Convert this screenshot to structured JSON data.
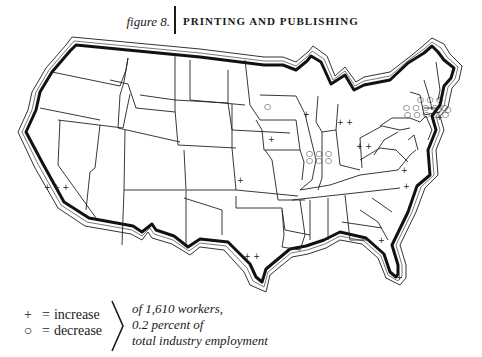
{
  "figure": {
    "label": "figure 8.",
    "title": "PRINTING AND PUBLISHING"
  },
  "legend": {
    "increase_glyph": "+",
    "increase_label": "increase",
    "decrease_glyph": "○",
    "decrease_label": "decrease",
    "equals": "=",
    "note_lines": [
      "of 1,610 workers,",
      "0.2 percent of",
      "total industry employment"
    ]
  },
  "map": {
    "subject": "United States by state",
    "unit": "1,610 workers per symbol",
    "symbols": [
      {
        "state": "California",
        "type": "increase",
        "count": 3,
        "glyph": "+++"
      },
      {
        "state": "Minnesota",
        "type": "decrease",
        "count": 1,
        "glyph": "○"
      },
      {
        "state": "Wisconsin",
        "type": "increase",
        "count": 1,
        "glyph": "+"
      },
      {
        "state": "Iowa",
        "type": "increase",
        "count": 1,
        "glyph": "+"
      },
      {
        "state": "Kansas",
        "type": "increase",
        "count": 1,
        "glyph": "+"
      },
      {
        "state": "Texas",
        "type": "increase",
        "count": 2,
        "glyph": "++"
      },
      {
        "state": "Illinois",
        "type": "decrease",
        "count": 6,
        "glyph": "○○○ ○○○"
      },
      {
        "state": "Michigan",
        "type": "increase",
        "count": 2,
        "glyph": "++"
      },
      {
        "state": "Ohio",
        "type": "increase",
        "count": 2,
        "glyph": "++"
      },
      {
        "state": "New York",
        "type": "decrease",
        "count": 13,
        "glyph": "○○○ ○○○○○ ○○○○○"
      },
      {
        "state": "Massachusetts",
        "type": "decrease",
        "count": 2,
        "glyph": "○○"
      },
      {
        "state": "Connecticut",
        "type": "increase",
        "count": 1,
        "glyph": "+"
      },
      {
        "state": "Virginia",
        "type": "increase",
        "count": 1,
        "glyph": "+"
      },
      {
        "state": "North Carolina",
        "type": "increase",
        "count": 1,
        "glyph": "+"
      },
      {
        "state": "Georgia",
        "type": "increase",
        "count": 1,
        "glyph": "+"
      },
      {
        "state": "Florida",
        "type": "increase",
        "count": 1,
        "glyph": "+"
      }
    ]
  },
  "symbols_text": {
    "ca": "+ + +",
    "mn": "○",
    "wi": "+",
    "ia": "+",
    "ks": "+",
    "tx": "+ +",
    "il_1": "○ ○ ○",
    "il_2": "○ ○ ○",
    "mi": "+ +",
    "oh": "+ +",
    "ny_1": "○ ○ ○",
    "ny_2": "○ ○ ○ ○ ○",
    "ny_3": "○ ○ ○ ○ ○",
    "ma": "○ ○",
    "ct": "+",
    "va": "+",
    "nc": "+",
    "ga": "+",
    "fl": "+"
  }
}
